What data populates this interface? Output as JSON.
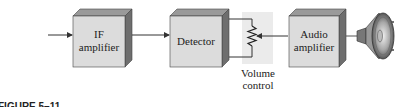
{
  "diagram": {
    "blocks": [
      {
        "id": "if-amplifier",
        "lines": [
          "IF",
          "amplifier"
        ]
      },
      {
        "id": "detector",
        "lines": [
          "Detector"
        ]
      },
      {
        "id": "audio-amplifier",
        "lines": [
          "Audio",
          "amplifier"
        ]
      }
    ],
    "volume_control": {
      "lines": [
        "Volume",
        "control"
      ]
    },
    "caption": "FIGURE 5–11",
    "colors": {
      "block_front": "#dcdcdc",
      "block_top": "#9a9a9a",
      "block_side": "#6e6e6e",
      "pot_background": "#ebebeb",
      "line": "#333333"
    }
  }
}
